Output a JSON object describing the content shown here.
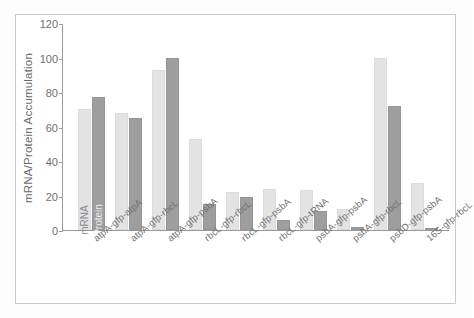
{
  "chart_data": {
    "type": "bar",
    "title": "",
    "xlabel": "",
    "ylabel": "mRNA/Protein Accumulation",
    "ylim": [
      0,
      120
    ],
    "yticks": [
      120,
      100,
      80,
      60,
      40,
      20,
      0
    ],
    "grid": false,
    "legend_position": "inside-first-group-rotated",
    "categories": [
      "atpA-gfp-atpA",
      "atpA-gfp-rbcL",
      "atpA-gfp-psbA",
      "rbcL-gfp-rbcL",
      "rbcL-gfp-psbA",
      "rbcL-gfp-tRNA",
      "psbA-gfp-psbA",
      "psbA-gfp-rbcL",
      "psbD-gfp-psbA",
      "16S-gfp-rbcL"
    ],
    "series": [
      {
        "name": "mRNA",
        "color": "#e3e3e3",
        "values": [
          70,
          68,
          93,
          53,
          22,
          24,
          23,
          12,
          100,
          27
        ]
      },
      {
        "name": "Protein",
        "color": "#9e9e9e",
        "values": [
          77,
          65,
          100,
          15,
          19,
          6,
          11,
          2,
          72,
          1
        ]
      }
    ]
  },
  "legend": {
    "mrna_label": "mRNA",
    "protein_label": "Protein"
  }
}
